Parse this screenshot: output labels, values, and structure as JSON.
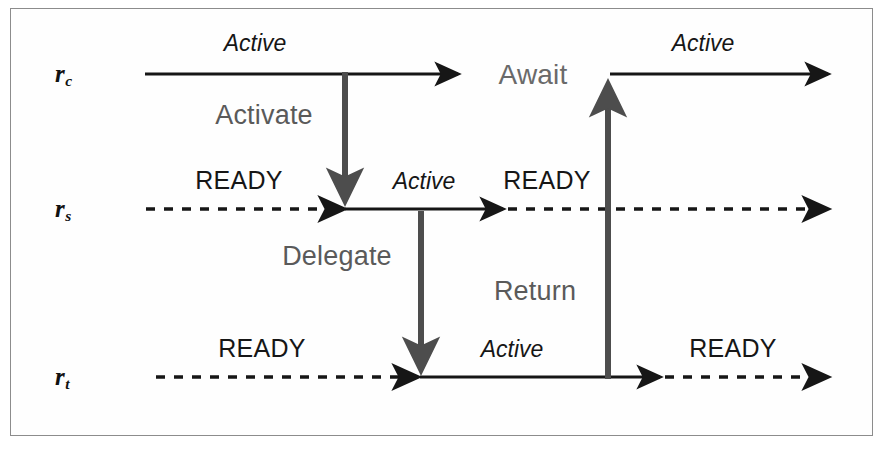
{
  "figure": {
    "background_color": "#ffffff",
    "frame_color": "#8c8c8c",
    "line_color": "#161616",
    "message_color": "#5a5a5a",
    "await_color": "#6a6a6a"
  },
  "lanes": [
    {
      "id": "rc",
      "label_base": "r",
      "label_sub": "c",
      "y": 75
    },
    {
      "id": "rs",
      "label_base": "r",
      "label_sub": "s",
      "y": 210
    },
    {
      "id": "rt",
      "label_base": "r",
      "label_sub": "t",
      "y": 378
    }
  ],
  "state_labels": {
    "rc_active_left": "Active",
    "rc_await": "Await",
    "rc_active_right": "Active",
    "rs_ready_left": "READY",
    "rs_active": "Active",
    "rs_ready_right": "READY",
    "rt_ready_left": "READY",
    "rt_active": "Active",
    "rt_ready_right": "READY"
  },
  "messages": {
    "activate": "Activate",
    "delegate": "Delegate",
    "return": "Return"
  }
}
